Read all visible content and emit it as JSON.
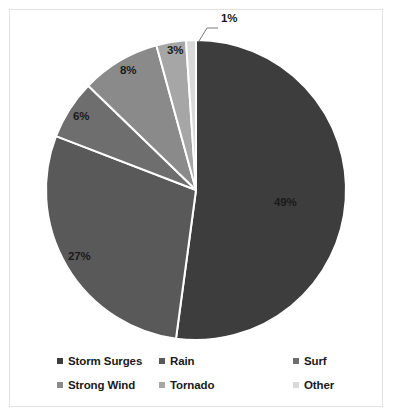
{
  "chart_data": {
    "type": "pie",
    "title": "",
    "labels": [
      "Storm Surges",
      "Rain",
      "Surf",
      "Strong Wind",
      "Tornado",
      "Other"
    ],
    "values": [
      49,
      27,
      6,
      8,
      3,
      1
    ],
    "value_labels": [
      "49%",
      "27%",
      "6%",
      "8%",
      "3%",
      "1%"
    ],
    "unit": "%",
    "colors": [
      "#3d3d3d",
      "#595959",
      "#6e6e6e",
      "#8a8a8a",
      "#a6a6a6",
      "#d9d9d9"
    ],
    "slice_separator_color": "#ffffff",
    "start_angle_deg": 0,
    "direction": "clockwise",
    "legend": {
      "position": "bottom",
      "columns": 3,
      "rows": 2,
      "entries": [
        {
          "label": "Storm Surges",
          "color": "#3d3d3d"
        },
        {
          "label": "Rain",
          "color": "#595959"
        },
        {
          "label": "Surf",
          "color": "#6e6e6e"
        },
        {
          "label": "Strong Wind",
          "color": "#8a8a8a"
        },
        {
          "label": "Tornado",
          "color": "#a6a6a6"
        },
        {
          "label": "Other",
          "color": "#d9d9d9"
        }
      ]
    },
    "callout": {
      "label": "1%",
      "has_leader_line": true
    },
    "frame_border_color": "#e2e2e2",
    "background_color": "#ffffff"
  }
}
